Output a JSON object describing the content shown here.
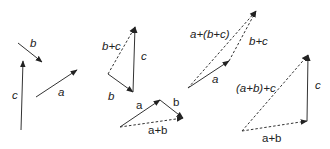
{
  "diagram": {
    "stroke_color": "#333333",
    "groups": [
      {
        "name": "individual-vectors",
        "vectors": [
          {
            "label": "b",
            "from": [
              18,
              43
            ],
            "to": [
              42,
              62
            ],
            "style": "solid",
            "label_pos": [
              30,
              47
            ],
            "italic": true
          },
          {
            "label": "c",
            "from": [
              21,
              130
            ],
            "to": [
              23,
              61
            ],
            "style": "solid",
            "label_pos": [
              12,
              99
            ],
            "italic": true
          },
          {
            "label": "a",
            "from": [
              36,
              97
            ],
            "to": [
              77,
              70
            ],
            "style": "solid",
            "label_pos": [
              58,
              96
            ],
            "italic": true
          }
        ]
      },
      {
        "name": "b-plus-c-triangle",
        "vectors": [
          {
            "label": "b",
            "from": [
              108,
              74
            ],
            "to": [
              133,
              92
            ],
            "style": "solid",
            "label_pos": [
              108,
              100
            ],
            "italic": true
          },
          {
            "label": "c",
            "from": [
              133,
              92
            ],
            "to": [
              135,
              27
            ],
            "style": "solid",
            "label_pos": [
              141,
              60
            ],
            "italic": true
          },
          {
            "label": "b+c",
            "from": [
              108,
              74
            ],
            "to": [
              135,
              27
            ],
            "style": "dashed",
            "label_pos": [
              102,
              50
            ],
            "italic": true
          }
        ]
      },
      {
        "name": "a-plus-b-triangle",
        "vectors": [
          {
            "label": "a",
            "from": [
              120,
              127
            ],
            "to": [
              160,
              100
            ],
            "style": "solid",
            "label_pos": [
              136,
              109
            ],
            "italic": false
          },
          {
            "label": "b",
            "from": [
              160,
              100
            ],
            "to": [
              183,
              118
            ],
            "style": "solid",
            "label_pos": [
              173,
              106
            ],
            "italic": false
          },
          {
            "label": "a+b",
            "from": [
              120,
              127
            ],
            "to": [
              183,
              118
            ],
            "style": "dashed",
            "label_pos": [
              148,
              134
            ],
            "italic": false
          }
        ]
      },
      {
        "name": "a-plus-bc-triangle",
        "vectors": [
          {
            "label": "a",
            "from": [
              188,
              88
            ],
            "to": [
              229,
              61
            ],
            "style": "solid",
            "label_pos": [
              212,
              83
            ],
            "italic": true
          },
          {
            "label": "b+c",
            "from": [
              229,
              61
            ],
            "to": [
              256,
              11
            ],
            "style": "dashed",
            "label_pos": [
              249,
              45
            ],
            "italic": true
          },
          {
            "label": "a+(b+c)",
            "from": [
              188,
              88
            ],
            "to": [
              256,
              11
            ],
            "style": "dashed",
            "label_pos": [
              190,
              38
            ],
            "italic": true
          }
        ]
      },
      {
        "name": "ab-plus-c-triangle",
        "vectors": [
          {
            "label": "a+b",
            "from": [
              242,
              131
            ],
            "to": [
              307,
              121
            ],
            "style": "dashed",
            "label_pos": [
              262,
              142
            ],
            "italic": false
          },
          {
            "label": "c",
            "from": [
              307,
              121
            ],
            "to": [
              308,
              55
            ],
            "style": "solid",
            "label_pos": [
              315,
              89
            ],
            "italic": true
          },
          {
            "label": "(a+b)+c",
            "from": [
              242,
              131
            ],
            "to": [
              308,
              55
            ],
            "style": "dashed",
            "label_pos": [
              236,
              92
            ],
            "italic": true
          }
        ]
      }
    ]
  }
}
